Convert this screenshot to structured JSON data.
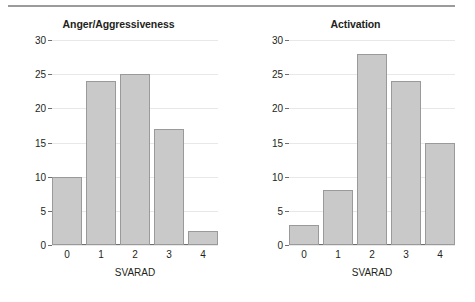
{
  "figure": {
    "separator_rule": true
  },
  "chart_data": [
    {
      "type": "bar",
      "title": "Anger/Aggressiveness",
      "xlabel": "SVARAD",
      "ylabel": "N. of patients",
      "categories": [
        "0",
        "1",
        "2",
        "3",
        "4"
      ],
      "values": [
        10,
        24,
        25,
        17,
        2
      ],
      "ylim": [
        0,
        30
      ],
      "yticks": [
        0,
        5,
        10,
        15,
        20,
        25,
        30
      ],
      "grid": true,
      "legend": "none",
      "bar_fill": "#c9c9c9",
      "bar_border": "#9a9a9a"
    },
    {
      "type": "bar",
      "title": "Activation",
      "xlabel": "SVARAD",
      "ylabel": "N. of patients",
      "categories": [
        "0",
        "1",
        "2",
        "3",
        "4"
      ],
      "values": [
        3,
        8,
        28,
        24,
        15
      ],
      "ylim": [
        0,
        30
      ],
      "yticks": [
        0,
        5,
        10,
        15,
        20,
        25,
        30
      ],
      "grid": true,
      "legend": "none",
      "bar_fill": "#c9c9c9",
      "bar_border": "#9a9a9a"
    }
  ]
}
